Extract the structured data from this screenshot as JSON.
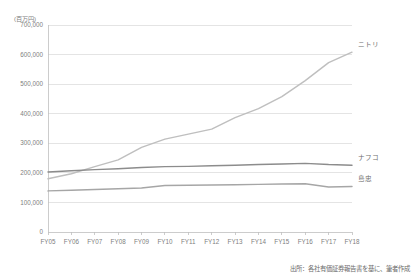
{
  "unit_label": "(百万円)",
  "source_note": "出所：各社有価証券報告書を基に、筆者作成",
  "axis": {
    "y_ticks": [
      "0",
      "100,000",
      "200,000",
      "300,000",
      "400,000",
      "500,000",
      "600,000",
      "700,000"
    ],
    "x_ticks": [
      "FY05",
      "FY06",
      "FY07",
      "FY08",
      "FY09",
      "FY10",
      "FY11",
      "FY12",
      "FY13",
      "FY14",
      "FY15",
      "FY16",
      "FY17",
      "FY18"
    ]
  },
  "series_labels": {
    "nitori": "ニトリ",
    "nafco": "ナフコ",
    "shimachu": "島忠"
  },
  "colors": {
    "nitori": "#bfbfbf",
    "nafco": "#8c8c8c",
    "shimachu": "#a6a6a6",
    "gridline": "#d9d9d9",
    "axis": "#bfbfbf",
    "text": "#808080"
  },
  "chart_data": {
    "type": "line",
    "title": "",
    "xlabel": "",
    "ylabel": "(百万円)",
    "ylim": [
      0,
      700000
    ],
    "ytick_step": 100000,
    "grid": true,
    "legend_position": "line-end-labels",
    "categories": [
      "FY05",
      "FY06",
      "FY07",
      "FY08",
      "FY09",
      "FY10",
      "FY11",
      "FY12",
      "FY13",
      "FY14",
      "FY15",
      "FY16",
      "FY17",
      "FY18"
    ],
    "series": [
      {
        "name": "ニトリ",
        "color": "#bfbfbf",
        "values": [
          180000,
          197000,
          221000,
          244000,
          286000,
          314000,
          331000,
          348000,
          387000,
          417000,
          458000,
          512000,
          573000,
          608000
        ]
      },
      {
        "name": "ナフコ",
        "color": "#8c8c8c",
        "values": [
          203000,
          207000,
          211000,
          214000,
          218000,
          221000,
          222000,
          224000,
          226000,
          228000,
          230000,
          232000,
          228000,
          226000
        ]
      },
      {
        "name": "島忠",
        "color": "#a6a6a6",
        "values": [
          139000,
          141000,
          144000,
          146000,
          149000,
          157000,
          158000,
          159000,
          160000,
          161000,
          162000,
          163000,
          152000,
          154000
        ]
      }
    ]
  }
}
